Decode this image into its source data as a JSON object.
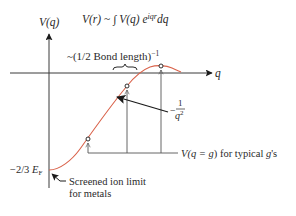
{
  "diagram": {
    "formula": {
      "lhs": "V(r)",
      "rel": " ~ ∫ ",
      "integrand": "V(q) e",
      "exponent": "iqr",
      "diff": "dq"
    },
    "y_axis_label": "V(q)",
    "x_axis_label": "q",
    "bond_label": "~(1/2 Bond length)",
    "bond_exponent": "−1",
    "slope_label_prefix": "−",
    "slope_label_num": "1",
    "slope_label_den": "q",
    "slope_label_den_exp": "2",
    "g_label_prefix": "V(",
    "g_label_eq": "q = g",
    "g_label_suffix": ") for typical ",
    "g_label_g": "g",
    "g_label_end": "'s",
    "ef_label_prefix": "−2/3 ",
    "ef_label_E": "E",
    "ef_label_sub": "F",
    "screened_line1": "Screened ion limit",
    "screened_line2": "for metals",
    "colors": {
      "curve": "#d9624a",
      "axis": "#3a3a3a",
      "text": "#2a2a2a"
    }
  }
}
